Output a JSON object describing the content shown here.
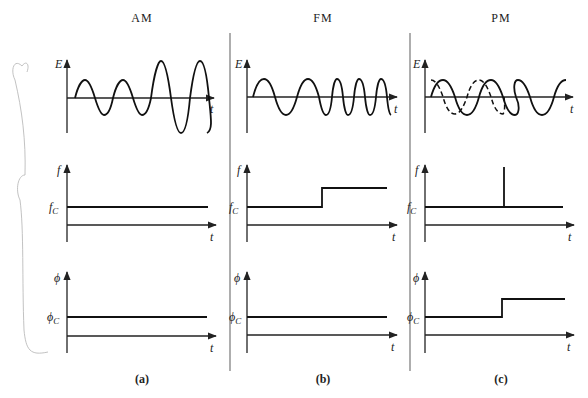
{
  "figure": {
    "columns": [
      {
        "id": "a",
        "title": "AM",
        "caption": "(a)",
        "rows": [
          {
            "ylabel": "E",
            "xlabel": "t",
            "description": "amplitude-modulated sinusoid: constant frequency, amplitude increases for last two cycles"
          },
          {
            "ylabel": "f",
            "ref_label": "f",
            "ref_sub": "C",
            "xlabel": "t",
            "description": "frequency constant at f_C"
          },
          {
            "ylabel": "ϕ",
            "ref_label": "ϕ",
            "ref_sub": "C",
            "xlabel": "t",
            "description": "phase constant at ϕ_C"
          }
        ]
      },
      {
        "id": "b",
        "title": "FM",
        "caption": "(b)",
        "rows": [
          {
            "ylabel": "E",
            "xlabel": "t",
            "description": "frequency-modulated sinusoid: two slow cycles then four faster cycles, constant amplitude"
          },
          {
            "ylabel": "f",
            "ref_label": "f",
            "ref_sub": "C",
            "xlabel": "t",
            "description": "frequency steps up from f_C midway"
          },
          {
            "ylabel": "ϕ",
            "ref_label": "ϕ",
            "ref_sub": "C",
            "xlabel": "t",
            "description": "phase constant at ϕ_C"
          }
        ]
      },
      {
        "id": "c",
        "title": "PM",
        "caption": "(c)",
        "rows": [
          {
            "ylabel": "E",
            "xlabel": "t",
            "description": "phase-modulated sinusoid (solid) vs. unshifted reference (dashed); solid lags until shift"
          },
          {
            "ylabel": "f",
            "ref_label": "f",
            "ref_sub": "C",
            "xlabel": "t",
            "description": "frequency constant at f_C with an impulse spike at the phase jump"
          },
          {
            "ylabel": "ϕ",
            "ref_label": "ϕ",
            "ref_sub": "C",
            "xlabel": "t",
            "description": "phase steps up from ϕ_C midway"
          }
        ]
      }
    ]
  }
}
